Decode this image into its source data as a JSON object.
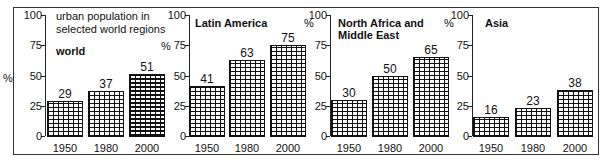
{
  "chart_data": [
    {
      "type": "bar",
      "title": "world",
      "subtitle": "urban population in selected world regions",
      "ylabel": "%",
      "categories": [
        "1950",
        "1980",
        "2000"
      ],
      "values": [
        29,
        37,
        51
      ],
      "yticks": [
        "0",
        "25",
        "50",
        "75",
        "100"
      ],
      "ylim": [
        0,
        100
      ],
      "grid": false
    },
    {
      "type": "bar",
      "title": "Latin America",
      "ylabel": "%",
      "categories": [
        "1950",
        "1980",
        "2000"
      ],
      "values": [
        41,
        63,
        75
      ],
      "yticks": [
        "0",
        "25",
        "50",
        "75",
        "100"
      ],
      "ylim": [
        0,
        100
      ],
      "grid": false
    },
    {
      "type": "bar",
      "title": "North Africa and Middle East",
      "ylabel": "%",
      "categories": [
        "1950",
        "1980",
        "2000"
      ],
      "values": [
        30,
        50,
        65
      ],
      "yticks": [
        "0",
        "25",
        "50",
        "75",
        "100"
      ],
      "ylim": [
        0,
        100
      ],
      "grid": false
    },
    {
      "type": "bar",
      "title": "Asia",
      "ylabel": "%",
      "categories": [
        "1950",
        "1980",
        "2000"
      ],
      "values": [
        16,
        23,
        38
      ],
      "yticks": [
        "0",
        "25",
        "50",
        "75",
        "100"
      ],
      "ylim": [
        0,
        100
      ],
      "grid": false
    }
  ],
  "labels": {
    "note_line1": "urban population in",
    "note_line2": "selected world regions",
    "p1_title": "world",
    "p2_title": "Latin America",
    "p3_title_line1": "North Africa and",
    "p3_title_line2": "Middle East",
    "p4_title": "Asia",
    "percent": "%",
    "t0": "0",
    "t25": "25",
    "t50": "50",
    "t75": "75",
    "t100": "100",
    "y1950": "1950",
    "y1980": "1980",
    "y2000": "2000"
  }
}
